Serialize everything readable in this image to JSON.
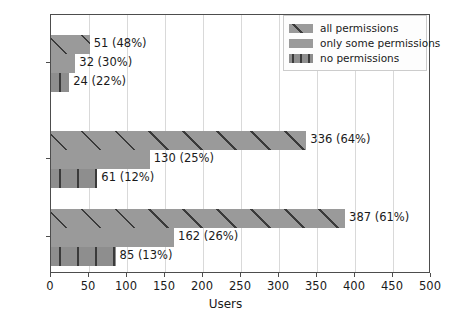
{
  "chart_data": {
    "type": "bar",
    "orientation": "horizontal",
    "title": "",
    "xlabel": "Users",
    "ylabel": "",
    "xlim": [
      0,
      500
    ],
    "xticks": [
      0,
      50,
      100,
      150,
      200,
      250,
      300,
      350,
      400,
      450,
      500
    ],
    "grid": "vertical",
    "legend_position": "upper right",
    "categories": [
      "female",
      "male",
      "sum"
    ],
    "series": [
      {
        "name": "all permissions",
        "pattern": "diagonal-hatch",
        "color": "#9a9a9a",
        "values": [
          51,
          336,
          387
        ],
        "percents": [
          48,
          64,
          61
        ],
        "labels": [
          "51 (48%)",
          "336 (64%)",
          "387 (61%)"
        ]
      },
      {
        "name": "only some permissions",
        "pattern": "solid",
        "color": "#9a9a9a",
        "values": [
          32,
          130,
          162
        ],
        "percents": [
          30,
          25,
          26
        ],
        "labels": [
          "32 (30%)",
          "130 (25%)",
          "162 (26%)"
        ]
      },
      {
        "name": "no permissions",
        "pattern": "vertical-hatch",
        "color": "#8e8e8e",
        "values": [
          24,
          61,
          85
        ],
        "percents": [
          22,
          12,
          13
        ],
        "labels": [
          "24 (22%)",
          "61 (12%)",
          "85 (13%)"
        ]
      }
    ]
  },
  "axis": {
    "x_title": "Users",
    "x_tick_labels": [
      "0",
      "50",
      "100",
      "150",
      "200",
      "250",
      "300",
      "350",
      "400",
      "450",
      "500"
    ],
    "y_tick_labels": [
      "female",
      "male",
      "sum"
    ]
  },
  "legend": {
    "entries": [
      {
        "label": "all permissions"
      },
      {
        "label": "only some permissions"
      },
      {
        "label": "no permissions"
      }
    ]
  },
  "bars": [
    {
      "group": "female",
      "series": "all permissions",
      "value": 51,
      "label": "51 (48%)"
    },
    {
      "group": "female",
      "series": "only some permissions",
      "value": 32,
      "label": "32 (30%)"
    },
    {
      "group": "female",
      "series": "no permissions",
      "value": 24,
      "label": "24 (22%)"
    },
    {
      "group": "male",
      "series": "all permissions",
      "value": 336,
      "label": "336 (64%)"
    },
    {
      "group": "male",
      "series": "only some permissions",
      "value": 130,
      "label": "130 (25%)"
    },
    {
      "group": "male",
      "series": "no permissions",
      "value": 61,
      "label": "61 (12%)"
    },
    {
      "group": "sum",
      "series": "all permissions",
      "value": 387,
      "label": "387 (61%)"
    },
    {
      "group": "sum",
      "series": "only some permissions",
      "value": 162,
      "label": "162 (26%)"
    },
    {
      "group": "sum",
      "series": "no permissions",
      "value": 85,
      "label": "85 (13%)"
    }
  ]
}
